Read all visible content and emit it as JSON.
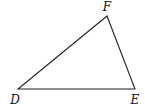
{
  "diagram": {
    "type": "triangle",
    "stroke_color": "#222222",
    "vertices": [
      {
        "label": "D",
        "x": 18,
        "y": 89,
        "label_x": 15,
        "label_y": 104
      },
      {
        "label": "E",
        "x": 135,
        "y": 89,
        "label_x": 135,
        "label_y": 104
      },
      {
        "label": "F",
        "x": 107,
        "y": 16,
        "label_x": 107,
        "label_y": 11
      }
    ]
  }
}
